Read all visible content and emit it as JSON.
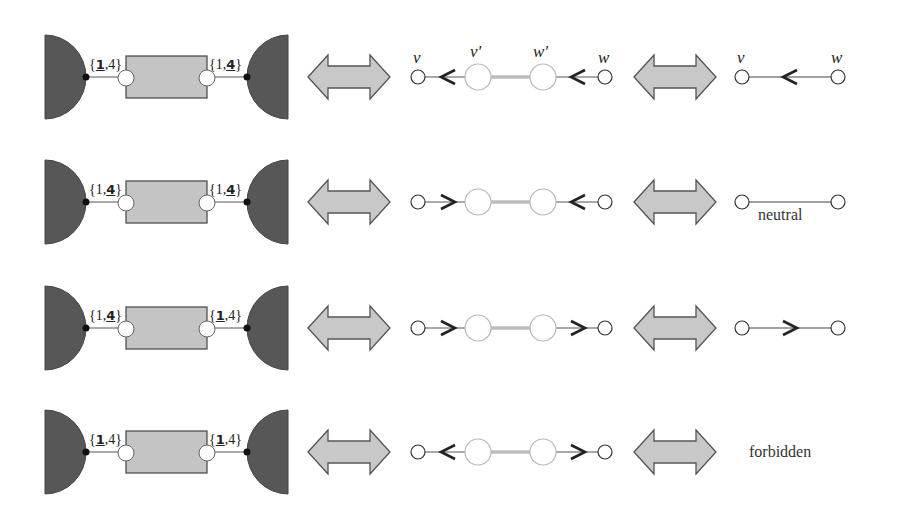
{
  "colors": {
    "half_disk": "#575757",
    "gadget_box": "#c4c4c4",
    "double_arrow": "#c8c8c8",
    "stroke": "#333333",
    "gadget_link": "#bdbdbd",
    "light_circle": "#b8b8b8"
  },
  "vertex_labels": {
    "v": "v",
    "v_prime": "v'",
    "w_prime": "w'",
    "w": "w"
  },
  "rows": [
    {
      "left_label": {
        "open": "{",
        "first": "1",
        "sep": ",",
        "second": "4",
        "close": "}",
        "bold": "first"
      },
      "right_label": {
        "open": "{",
        "first": "1",
        "sep": ",",
        "second": "4",
        "close": "}",
        "bold": "second"
      },
      "gadget_arrows": [
        "left",
        "left"
      ],
      "result": {
        "type": "edge",
        "arrow": "left",
        "show_vertex_labels": true,
        "text": ""
      }
    },
    {
      "left_label": {
        "open": "{",
        "first": "1",
        "sep": ",",
        "second": "4",
        "close": "}",
        "bold": "second"
      },
      "right_label": {
        "open": "{",
        "first": "1",
        "sep": ",",
        "second": "4",
        "close": "}",
        "bold": "second"
      },
      "gadget_arrows": [
        "right",
        "left"
      ],
      "result": {
        "type": "edge",
        "arrow": "none",
        "show_vertex_labels": false,
        "text": "neutral"
      }
    },
    {
      "left_label": {
        "open": "{",
        "first": "1",
        "sep": ",",
        "second": "4",
        "close": "}",
        "bold": "second"
      },
      "right_label": {
        "open": "{",
        "first": "1",
        "sep": ",",
        "second": "4",
        "close": "}",
        "bold": "first"
      },
      "gadget_arrows": [
        "right",
        "right"
      ],
      "result": {
        "type": "edge",
        "arrow": "right",
        "show_vertex_labels": false,
        "text": ""
      }
    },
    {
      "left_label": {
        "open": "{",
        "first": "1",
        "sep": ",",
        "second": "4",
        "close": "}",
        "bold": "first"
      },
      "right_label": {
        "open": "{",
        "first": "1",
        "sep": ",",
        "second": "4",
        "close": "}",
        "bold": "first"
      },
      "gadget_arrows": [
        "left",
        "right"
      ],
      "result": {
        "type": "text",
        "arrow": "none",
        "show_vertex_labels": false,
        "text": "forbidden"
      }
    }
  ],
  "layout": {
    "row_centers_y": [
      77,
      202,
      328,
      452
    ]
  }
}
